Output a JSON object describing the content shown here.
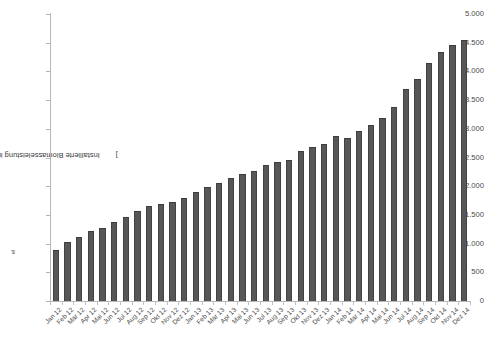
{
  "chart_data": {
    "type": "bar",
    "title": "",
    "subtitle": "",
    "xlabel": "",
    "ylabel": "Installierte Biomasseleistung in der Direktvermarktung [MW",
    "ylabel_sub": "el",
    "ylabel_suffix": "]",
    "ylim": [
      0,
      5000
    ],
    "ytick_step": 500,
    "ytick_labels": [
      "5.000",
      "4.500",
      "4.000",
      "3.500",
      "3.000",
      "2.500",
      "2.000",
      "1.500",
      "1.000",
      "500",
      "0"
    ],
    "ytick_values": [
      5000,
      4500,
      4000,
      3500,
      3000,
      2500,
      2000,
      1500,
      1000,
      500,
      0
    ],
    "grid": false,
    "legend": null,
    "bar_color": "#575757",
    "bar_edge_color": "#434343",
    "axis_color": "#b7b7b7",
    "categories": [
      "Jan 12",
      "Feb 12",
      "Mär 12",
      "Apr 12",
      "Mai 12",
      "Jun 12",
      "Jul 12",
      "Aug 12",
      "Sep 12",
      "Okt 12",
      "Nov 12",
      "Dez 12",
      "Jan 13",
      "Feb 13",
      "Mär 13",
      "Apr 13",
      "Mai 13",
      "Jun 13",
      "Jul 13",
      "Aug 13",
      "Sep 13",
      "Okt 13",
      "Nov 13",
      "Dez 13",
      "Jan 14",
      "Feb 14",
      "Mär 14",
      "Apr 14",
      "Mai 14",
      "Jun 14",
      "Jul 14",
      "Aug 14",
      "Sep 14",
      "Okt 14",
      "Nov 14",
      "Dez 14"
    ],
    "values": [
      880,
      1020,
      1120,
      1220,
      1280,
      1380,
      1460,
      1560,
      1660,
      1690,
      1730,
      1790,
      1900,
      1990,
      2060,
      2140,
      2220,
      2260,
      2370,
      2420,
      2460,
      2620,
      2680,
      2730,
      2880,
      2840,
      2960,
      3060,
      3180,
      3380,
      3700,
      3870,
      4150,
      4330,
      4460,
      4540
    ],
    "unit": "MW_el"
  }
}
